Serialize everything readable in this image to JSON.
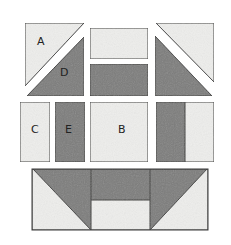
{
  "diagram": {
    "type": "quilt-block-pieces",
    "colors": {
      "light": "#eeeeec",
      "dark": "#7d7d7b",
      "stroke": "#3a3a3a",
      "background": "#ffffff"
    },
    "labels": {
      "A": "A",
      "B": "B",
      "C": "C",
      "D": "D",
      "E": "E"
    },
    "pieces": [
      {
        "id": "A",
        "shape": "triangle",
        "shade": "light",
        "position": "top-left upper"
      },
      {
        "id": "D",
        "shape": "triangle",
        "shade": "dark",
        "position": "top-left lower"
      },
      {
        "id": "top-middle-light",
        "shape": "rectangle",
        "shade": "light"
      },
      {
        "id": "top-middle-dark",
        "shape": "rectangle",
        "shade": "dark"
      },
      {
        "id": "top-right-light",
        "shape": "triangle",
        "shade": "light"
      },
      {
        "id": "top-right-dark",
        "shape": "triangle",
        "shade": "dark"
      },
      {
        "id": "C",
        "shape": "rectangle",
        "shade": "light"
      },
      {
        "id": "E",
        "shape": "rectangle",
        "shade": "dark"
      },
      {
        "id": "B",
        "shape": "square",
        "shade": "light"
      },
      {
        "id": "middle-right",
        "shape": "split-square",
        "shade": "dark/light"
      },
      {
        "id": "bottom-flying-geese",
        "shape": "flying-geese-unit",
        "shade": "dark/light"
      }
    ]
  }
}
